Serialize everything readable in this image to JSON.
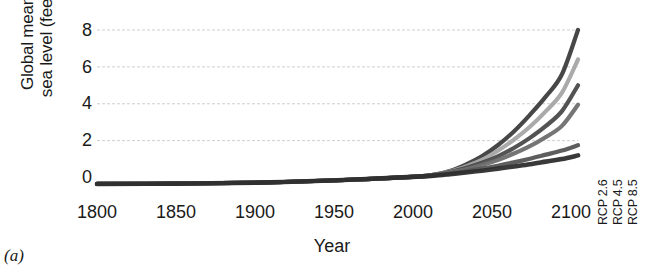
{
  "figure": {
    "panel_letter": "(a)",
    "background": "#ffffff",
    "axis_color": "#1a1a1a"
  },
  "chart_data": {
    "type": "line",
    "title": "",
    "xlabel": "Year",
    "ylabel": "Global mean\nsea level (feet)",
    "xlim": [
      1800,
      2100
    ],
    "ylim": [
      -1,
      8.6
    ],
    "xticks": [
      1800,
      1850,
      1900,
      1950,
      2000,
      2050,
      2100
    ],
    "yticks": [
      0,
      2,
      4,
      6,
      8
    ],
    "grid": "horizontal",
    "legend_position": "none",
    "x": [
      1800,
      1850,
      1900,
      1950,
      2000,
      2010,
      2020,
      2030,
      2040,
      2050,
      2060,
      2070,
      2080,
      2090,
      2100
    ],
    "series": [
      {
        "name": "Extreme",
        "color": "#3d3d3d",
        "width": 4.2,
        "values": [
          -0.35,
          -0.33,
          -0.28,
          -0.15,
          0.05,
          0.15,
          0.35,
          0.7,
          1.15,
          1.75,
          2.5,
          3.4,
          4.4,
          5.6,
          8.0
        ]
      },
      {
        "name": "High",
        "color": "#a5a5a5",
        "width": 4.2,
        "values": [
          -0.35,
          -0.33,
          -0.28,
          -0.15,
          0.05,
          0.15,
          0.32,
          0.6,
          0.95,
          1.45,
          2.05,
          2.75,
          3.6,
          4.6,
          6.4
        ]
      },
      {
        "name": "Intermediate-High",
        "color": "#4a4a4a",
        "width": 4.2,
        "values": [
          -0.35,
          -0.33,
          -0.28,
          -0.15,
          0.05,
          0.15,
          0.3,
          0.52,
          0.8,
          1.15,
          1.6,
          2.15,
          2.8,
          3.6,
          5.0
        ]
      },
      {
        "name": "Intermediate",
        "color": "#6e6e6e",
        "width": 4.2,
        "values": [
          -0.35,
          -0.33,
          -0.28,
          -0.15,
          0.05,
          0.15,
          0.28,
          0.45,
          0.68,
          0.95,
          1.3,
          1.7,
          2.2,
          2.8,
          3.95
        ]
      },
      {
        "name": "Intermediate-Low",
        "color": "#555555",
        "width": 4.2,
        "values": [
          -0.35,
          -0.33,
          -0.28,
          -0.15,
          0.05,
          0.12,
          0.22,
          0.34,
          0.48,
          0.64,
          0.82,
          1.02,
          1.24,
          1.46,
          1.75
        ]
      },
      {
        "name": "Low",
        "color": "#2e2e2e",
        "width": 4.6,
        "values": [
          -0.35,
          -0.33,
          -0.28,
          -0.15,
          0.05,
          0.1,
          0.18,
          0.27,
          0.37,
          0.48,
          0.6,
          0.72,
          0.86,
          1.0,
          1.2
        ]
      }
    ],
    "boxplots": [
      {
        "label": "RCP 2.6",
        "x_position": 2112,
        "box_low": 0.85,
        "box_high": 2.55,
        "whisker_high": 2.95,
        "whisker_low": 0.85,
        "color": "#666666"
      },
      {
        "label": "RCP 4.5",
        "x_position": 2124,
        "box_low": 1.15,
        "box_high": 2.85,
        "whisker_high": 4.1,
        "whisker_low": 1.15,
        "color": "#9e9e9e"
      },
      {
        "label": "RCP 8.5",
        "x_position": 2136,
        "box_low": 1.55,
        "box_high": 4.35,
        "whisker_high": 7.45,
        "whisker_low": 1.55,
        "color": "#4d4d4d"
      }
    ]
  }
}
